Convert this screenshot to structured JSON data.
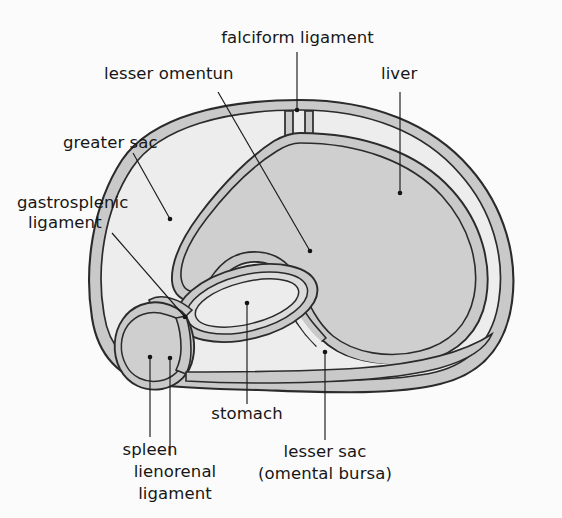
{
  "figure": {
    "type": "anatomical-diagram",
    "background_color": "#fbfbfb",
    "stroke_color": "#2b2b2b",
    "membrane_fill": "#c9c9c9",
    "cavity_fill": "#ededed",
    "organ_fill": "#cfcfcf",
    "leader_color": "#1a1a1a"
  },
  "labels": {
    "falciform_ligament": "falciform ligament",
    "lesser_omentum": "lesser omentun",
    "liver": "liver",
    "greater_sac": "greater sac",
    "gastrosplenic_ligament_line1": "gastrosplenic",
    "gastrosplenic_ligament_line2": "ligament",
    "spleen": "spleen",
    "lienorenal_ligament_line1": "lienorenal",
    "lienorenal_ligament_line2": "ligament",
    "stomach": "stomach",
    "lesser_sac_line1": "lesser sac",
    "lesser_sac_line2": "(omental bursa)"
  },
  "structures": [
    {
      "name": "liver",
      "description": "large comma-shaped organ, right side of section"
    },
    {
      "name": "stomach",
      "description": "oval organ, lower middle of section"
    },
    {
      "name": "spleen",
      "description": "small rounded organ, lower left of section"
    },
    {
      "name": "greater-sac",
      "description": "outer peritoneal cavity space"
    },
    {
      "name": "lesser-sac",
      "description": "omental bursa, enclosed space behind stomach"
    },
    {
      "name": "falciform-ligament",
      "description": "V-shaped peritoneal fold at top anterior"
    },
    {
      "name": "lesser-omentum",
      "description": "fold between liver and stomach"
    },
    {
      "name": "gastrosplenic-ligament",
      "description": "fold between stomach and spleen"
    },
    {
      "name": "lienorenal-ligament",
      "description": "fold from spleen to posterior wall"
    }
  ],
  "leaders": [
    {
      "name": "falciform-ligament",
      "from": [
        297,
        52
      ],
      "to": [
        297,
        110
      ]
    },
    {
      "name": "lesser-omentum",
      "from": [
        218,
        92
      ],
      "to": [
        310,
        251
      ]
    },
    {
      "name": "liver",
      "from": [
        400,
        92
      ],
      "to": [
        400,
        193
      ]
    },
    {
      "name": "greater-sac",
      "from": [
        133,
        153
      ],
      "to": [
        170,
        219
      ]
    },
    {
      "name": "gastrosplenic-ligament",
      "from": [
        112,
        233
      ],
      "to": [
        185,
        317
      ]
    },
    {
      "name": "spleen",
      "from": [
        150,
        437
      ],
      "to": [
        150,
        357
      ]
    },
    {
      "name": "lienorenal-ligament",
      "from": [
        170,
        456
      ],
      "to": [
        170,
        358
      ]
    },
    {
      "name": "stomach",
      "from": [
        247,
        404
      ],
      "to": [
        247,
        303
      ]
    },
    {
      "name": "lesser-sac",
      "from": [
        325,
        440
      ],
      "to": [
        325,
        352
      ]
    }
  ]
}
